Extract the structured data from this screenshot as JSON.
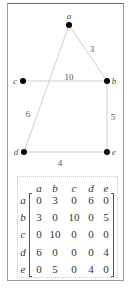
{
  "graph": {
    "nodes": [
      {
        "id": "a",
        "label": "a",
        "x": 69,
        "y": 25,
        "lx": 69,
        "ly": 16
      },
      {
        "id": "b",
        "label": "b",
        "x": 107,
        "y": 81,
        "lx": 114,
        "ly": 81
      },
      {
        "id": "c",
        "label": "c",
        "x": 23,
        "y": 81,
        "lx": 15,
        "ly": 81
      },
      {
        "id": "d",
        "label": "d",
        "x": 24,
        "y": 152,
        "lx": 16,
        "ly": 152
      },
      {
        "id": "e",
        "label": "e",
        "x": 107,
        "y": 152,
        "lx": 114,
        "ly": 152
      }
    ],
    "edges": [
      {
        "from": "a",
        "to": "b",
        "weight": "3",
        "lx": 92,
        "ly": 49
      },
      {
        "from": "c",
        "to": "b",
        "weight": "10",
        "lx": 69,
        "ly": 77
      },
      {
        "from": "a",
        "to": "d",
        "weight": "6",
        "lx": 28,
        "ly": 114
      },
      {
        "from": "b",
        "to": "e",
        "weight": "5",
        "lx": 113,
        "ly": 117
      },
      {
        "from": "d",
        "to": "e",
        "weight": "4",
        "lx": 60,
        "ly": 163
      }
    ]
  },
  "matrix": {
    "column_headers": [
      "a",
      "b",
      "c",
      "d",
      "e"
    ],
    "row_headers": [
      "a",
      "b",
      "c",
      "d",
      "e"
    ],
    "rows": [
      [
        "0",
        "3",
        "0",
        "6",
        "0"
      ],
      [
        "3",
        "0",
        "10",
        "0",
        "5"
      ],
      [
        "0",
        "10",
        "0",
        "0",
        "0"
      ],
      [
        "6",
        "0",
        "0",
        "0",
        "4"
      ],
      [
        "0",
        "5",
        "0",
        "4",
        "0"
      ]
    ]
  }
}
